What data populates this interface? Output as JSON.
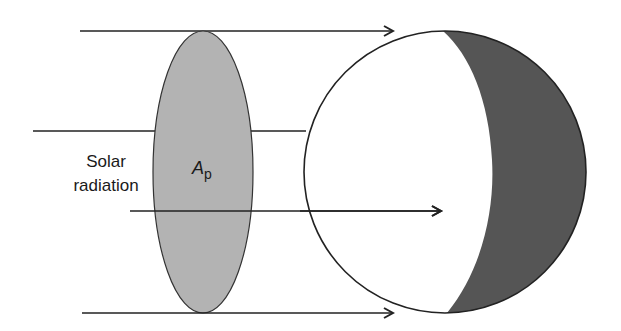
{
  "diagram": {
    "labels": {
      "solar_line1": "Solar",
      "solar_line2": "radiation",
      "area_symbol": "A",
      "area_subscript": "p"
    },
    "colors": {
      "ellipse_fill": "#b3b3b3",
      "night_side_fill": "#555555",
      "line": "#222222",
      "background": "#ffffff"
    },
    "elements": {
      "rays": 4,
      "projected_area_ellipse": "A_p",
      "sphere": "planet with illuminated (white) and dark (shaded) hemispheres"
    }
  }
}
